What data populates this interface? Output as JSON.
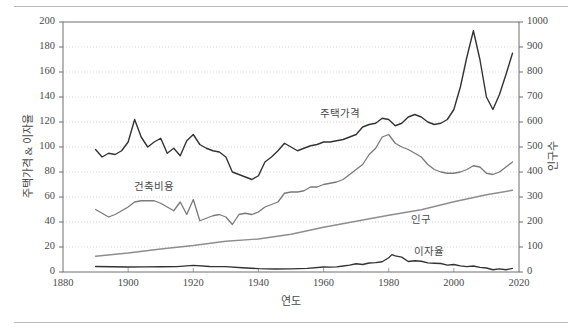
{
  "figure": {
    "top_rule": "horizontal-rule",
    "bottom_rule": "horizontal-rule"
  },
  "chart_data": {
    "type": "line",
    "title": "",
    "subtitle": "",
    "xlabel": "연도",
    "ylabel": "주택가격 & 이자율",
    "ylabel_right": "인구수",
    "xlim": [
      1880,
      2020
    ],
    "ylim": [
      0,
      200
    ],
    "ylim_right": [
      0,
      1000
    ],
    "xticks": [
      1880,
      1900,
      1920,
      1940,
      1960,
      1980,
      2000,
      2020
    ],
    "yticks": [
      0,
      20,
      40,
      60,
      80,
      100,
      120,
      140,
      160,
      180,
      200
    ],
    "yticks_right": [
      0,
      100,
      200,
      300,
      400,
      500,
      600,
      700,
      800,
      900,
      1000
    ],
    "grid": true,
    "grid_style": "dotted-horizontal",
    "legend": "inline-annotations",
    "annotations": [
      {
        "text": "주택가격",
        "x": 1965,
        "y": 128,
        "series": "housing_price"
      },
      {
        "text": "건축비용",
        "x": 1908,
        "y": 70,
        "series": "construction_cost"
      },
      {
        "text": "인구",
        "x": 1993,
        "y": 43,
        "series": "population"
      },
      {
        "text": "이자율",
        "x": 1994,
        "y": 18,
        "series": "interest_rate"
      }
    ],
    "series": [
      {
        "name": "주택가격",
        "key": "housing_price",
        "axis": "left",
        "color": "#333333",
        "width": 1.4,
        "x": [
          1890,
          1892,
          1894,
          1896,
          1898,
          1900,
          1902,
          1904,
          1906,
          1908,
          1910,
          1912,
          1914,
          1916,
          1918,
          1920,
          1922,
          1924,
          1926,
          1928,
          1930,
          1932,
          1934,
          1936,
          1938,
          1940,
          1942,
          1944,
          1946,
          1948,
          1950,
          1952,
          1954,
          1956,
          1958,
          1960,
          1962,
          1964,
          1966,
          1968,
          1970,
          1972,
          1974,
          1976,
          1978,
          1980,
          1982,
          1984,
          1986,
          1988,
          1990,
          1992,
          1994,
          1996,
          1998,
          2000,
          2002,
          2004,
          2006,
          2008,
          2010,
          2012,
          2014,
          2016,
          2018
        ],
        "values": [
          98,
          92,
          95,
          94,
          97,
          104,
          122,
          108,
          100,
          104,
          107,
          95,
          99,
          93,
          105,
          110,
          102,
          99,
          97,
          96,
          92,
          80,
          78,
          76,
          74,
          77,
          88,
          92,
          97,
          103,
          100,
          97,
          99,
          101,
          102,
          104,
          104,
          105,
          106,
          108,
          110,
          116,
          118,
          119,
          123,
          122,
          117,
          119,
          124,
          126,
          124,
          120,
          118,
          119,
          122,
          130,
          148,
          172,
          193,
          170,
          140,
          130,
          142,
          158,
          175
        ]
      },
      {
        "name": "건축비용",
        "key": "construction_cost",
        "axis": "left",
        "color": "#7a7a7a",
        "width": 1.3,
        "x": [
          1890,
          1892,
          1894,
          1896,
          1898,
          1900,
          1902,
          1904,
          1906,
          1908,
          1910,
          1912,
          1914,
          1916,
          1918,
          1920,
          1922,
          1924,
          1926,
          1928,
          1930,
          1932,
          1934,
          1936,
          1938,
          1940,
          1942,
          1944,
          1946,
          1948,
          1950,
          1952,
          1954,
          1956,
          1958,
          1960,
          1962,
          1964,
          1966,
          1968,
          1970,
          1972,
          1974,
          1976,
          1978,
          1980,
          1982,
          1984,
          1986,
          1988,
          1990,
          1992,
          1994,
          1996,
          1998,
          2000,
          2002,
          2004,
          2006,
          2008,
          2010,
          2012,
          2014,
          2016,
          2018
        ],
        "values": [
          50,
          47,
          44,
          46,
          49,
          52,
          56,
          57,
          57,
          57,
          55,
          52,
          49,
          56,
          46,
          58,
          41,
          43,
          45,
          46,
          44,
          38,
          46,
          47,
          46,
          48,
          52,
          54,
          56,
          63,
          64,
          64,
          65,
          68,
          68,
          70,
          71,
          72,
          74,
          78,
          82,
          86,
          94,
          99,
          108,
          110,
          103,
          100,
          98,
          95,
          92,
          86,
          82,
          80,
          79,
          79,
          80,
          82,
          85,
          84,
          79,
          78,
          80,
          84,
          88
        ]
      },
      {
        "name": "인구",
        "key": "population",
        "axis": "right",
        "color": "#8d8d8d",
        "width": 1.4,
        "unit": "millions",
        "x": [
          1890,
          1900,
          1910,
          1920,
          1930,
          1940,
          1950,
          1960,
          1970,
          1980,
          1990,
          2000,
          2010,
          2018
        ],
        "values": [
          63,
          76,
          92,
          106,
          123,
          132,
          151,
          179,
          203,
          227,
          249,
          281,
          309,
          327
        ]
      },
      {
        "name": "이자율",
        "key": "interest_rate",
        "axis": "left",
        "color": "#333333",
        "width": 1.3,
        "unit": "percent",
        "x": [
          1890,
          1895,
          1900,
          1905,
          1910,
          1915,
          1920,
          1925,
          1930,
          1935,
          1940,
          1945,
          1950,
          1955,
          1960,
          1962,
          1964,
          1966,
          1968,
          1970,
          1972,
          1974,
          1976,
          1978,
          1980,
          1981,
          1982,
          1984,
          1986,
          1988,
          1990,
          1992,
          1994,
          1996,
          1998,
          2000,
          2002,
          2004,
          2006,
          2008,
          2010,
          2012,
          2014,
          2016,
          2018
        ],
        "values": [
          4.4,
          4.2,
          4.0,
          4.1,
          4.2,
          4.3,
          5.3,
          4.4,
          4.3,
          3.4,
          2.7,
          2.4,
          2.5,
          2.9,
          4.0,
          3.9,
          4.1,
          4.8,
          5.5,
          6.6,
          6.0,
          7.2,
          7.5,
          8.2,
          11.4,
          13.9,
          12.9,
          11.9,
          8.4,
          9.0,
          8.6,
          7.3,
          7.0,
          6.8,
          5.5,
          6.0,
          4.9,
          4.3,
          4.8,
          3.7,
          3.2,
          1.8,
          2.5,
          1.8,
          2.9
        ]
      }
    ]
  }
}
